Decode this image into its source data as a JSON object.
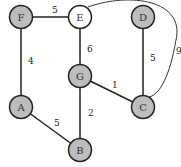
{
  "nodes": [
    {
      "id": "F",
      "label": "F",
      "x": 21,
      "y": 17,
      "fill": "#bdbdbd"
    },
    {
      "id": "E",
      "label": "E",
      "x": 80,
      "y": 17,
      "fill": "#ffffff"
    },
    {
      "id": "D",
      "label": "D",
      "x": 143,
      "y": 17,
      "fill": "#bdbdbd"
    },
    {
      "id": "G",
      "label": "G",
      "x": 80,
      "y": 76,
      "fill": "#bdbdbd"
    },
    {
      "id": "A",
      "label": "A",
      "x": 21,
      "y": 107,
      "fill": "#bdbdbd"
    },
    {
      "id": "C",
      "label": "C",
      "x": 143,
      "y": 107,
      "fill": "#bdbdbd"
    },
    {
      "id": "B",
      "label": "B",
      "x": 80,
      "y": 150,
      "fill": "#bdbdbd"
    }
  ],
  "edges": [
    {
      "from": "F",
      "to": "E",
      "weight": "5",
      "lx": 52,
      "ly": 13
    },
    {
      "from": "E",
      "to": "G",
      "weight": "6",
      "lx": 87,
      "ly": 52
    },
    {
      "from": "F",
      "to": "A",
      "weight": "4",
      "lx": 28,
      "ly": 64
    },
    {
      "from": "D",
      "to": "C",
      "weight": "5",
      "lx": 150,
      "ly": 61
    },
    {
      "from": "G",
      "to": "C",
      "weight": "1",
      "lx": 112,
      "ly": 88
    },
    {
      "from": "G",
      "to": "B",
      "weight": "2",
      "lx": 88,
      "ly": 116
    },
    {
      "from": "A",
      "to": "B",
      "weight": "5",
      "lx": 54,
      "ly": 126
    },
    {
      "from": "E",
      "to": "C",
      "weight": "9",
      "lx": 176,
      "ly": 54,
      "curved": true
    }
  ]
}
